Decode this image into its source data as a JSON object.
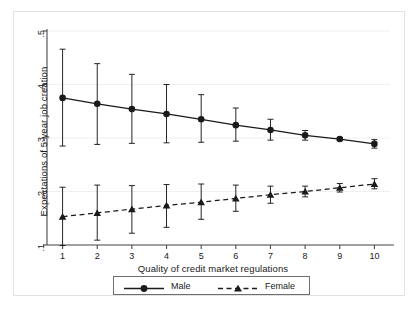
{
  "figure": {
    "background_color": "#ffffff",
    "frame_color": "#e2e2e2",
    "axis_color": "#4a4a4a",
    "grid_color": "#f0f0f0",
    "series_color": "#1a1a1a"
  },
  "axes": {
    "x_title": "Quality of credit market regulations",
    "y_title": "Expectations of 5-year job creation",
    "x_ticks": [
      "1",
      "2",
      "3",
      "4",
      "5",
      "6",
      "7",
      "8",
      "9",
      "10"
    ],
    "y_ticks": [
      ".1",
      ".2",
      ".3",
      ".4",
      ".5"
    ]
  },
  "legend": {
    "items": [
      {
        "label": "Male",
        "marker": "circle",
        "line": "solid"
      },
      {
        "label": "Female",
        "marker": "triangle",
        "line": "dashed"
      }
    ]
  },
  "chart_data": {
    "type": "line",
    "title": "",
    "subtitle": "",
    "xlabel": "Quality of credit market regulations",
    "ylabel": "Expectations of 5-year job creation",
    "x": [
      1,
      2,
      3,
      4,
      5,
      6,
      7,
      8,
      9,
      10
    ],
    "xtick_labels": [
      "1",
      "2",
      "3",
      "4",
      "5",
      "6",
      "7",
      "8",
      "9",
      "10"
    ],
    "ytick_labels": [
      ".1",
      ".2",
      ".3",
      ".4",
      ".5"
    ],
    "ytick_values": [
      0.1,
      0.2,
      0.3,
      0.4,
      0.5
    ],
    "xlim": [
      0.55,
      10.45
    ],
    "ylim": [
      0.09,
      0.515
    ],
    "grid": "horizontal",
    "legend_position": "bottom-outside",
    "error_bars": "95% confidence interval (capped)",
    "series": [
      {
        "name": "Male",
        "line_style": "solid",
        "marker": "circle",
        "values": [
          0.375,
          0.364,
          0.354,
          0.345,
          0.335,
          0.324,
          0.315,
          0.305,
          0.298,
          0.289
        ],
        "ci_low": [
          0.285,
          0.288,
          0.29,
          0.291,
          0.292,
          0.294,
          0.296,
          0.296,
          0.295,
          0.281
        ],
        "ci_high": [
          0.466,
          0.439,
          0.419,
          0.4,
          0.381,
          0.356,
          0.335,
          0.314,
          0.301,
          0.297
        ]
      },
      {
        "name": "Female",
        "line_style": "dashed",
        "marker": "triangle",
        "values": [
          0.153,
          0.16,
          0.167,
          0.174,
          0.18,
          0.187,
          0.194,
          0.2,
          0.207,
          0.214
        ],
        "ci_low": [
          0.099,
          0.109,
          0.122,
          0.133,
          0.148,
          0.163,
          0.178,
          0.19,
          0.199,
          0.205
        ],
        "ci_high": [
          0.208,
          0.212,
          0.211,
          0.213,
          0.214,
          0.212,
          0.21,
          0.21,
          0.215,
          0.224
        ]
      }
    ]
  }
}
